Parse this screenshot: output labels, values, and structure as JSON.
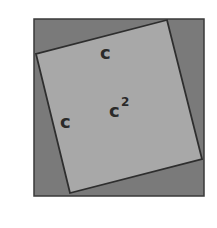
{
  "diagram": {
    "colors": {
      "outer_fill": "#7a7a7a",
      "inner_fill": "#a8a8a8",
      "stroke": "#2e2e2e",
      "label": "#2a2a2a"
    },
    "labels": {
      "top_side": "c",
      "left_side": "c",
      "area_base": "c",
      "area_exp": "2"
    }
  }
}
